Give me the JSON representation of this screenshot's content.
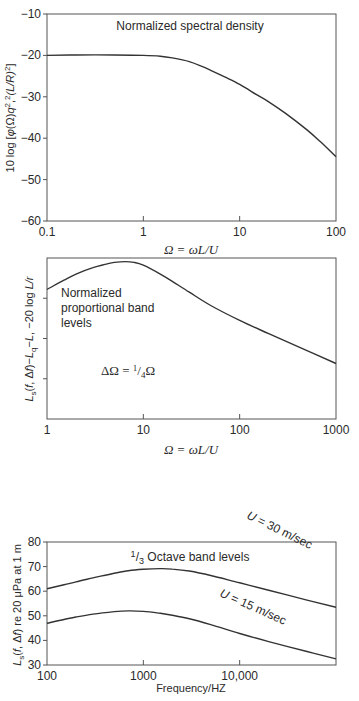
{
  "chart_data": [
    {
      "type": "line",
      "title": "Normalized spectral density",
      "xlabel": "Ω = ωL/U",
      "ylabel": "10 log [φ(Ω)q²,²(L/R)²]",
      "xscale": "log",
      "xlim": [
        0.1,
        100
      ],
      "ylim": [
        -60,
        -10
      ],
      "x_ticks": [
        "0.1",
        "1",
        "10",
        "100"
      ],
      "x_tick_values": [
        0.1,
        1,
        10,
        100
      ],
      "y_ticks": [
        "−10",
        "−20",
        "−30",
        "−40",
        "−50",
        "−60"
      ],
      "y_tick_values": [
        -10,
        -20,
        -30,
        -40,
        -50,
        -60
      ],
      "grid": false,
      "series": [
        {
          "name": "Normalized spectral density",
          "x": [
            0.1,
            0.2,
            0.5,
            1,
            1.5,
            2,
            3,
            4,
            5,
            7,
            10,
            15,
            20,
            30,
            50,
            70,
            100
          ],
          "y": [
            -20,
            -19.9,
            -19.9,
            -20,
            -20.2,
            -20.6,
            -21.5,
            -22.6,
            -23.6,
            -25.2,
            -27,
            -29.5,
            -31.2,
            -34,
            -38,
            -41,
            -44.5
          ]
        }
      ]
    },
    {
      "type": "line",
      "title": "Normalized proportional band levels",
      "annotation": "ΔΩ = ¼Ω",
      "xlabel": "Ω = ωL/U",
      "ylabel": "Ls(f, Δf)−Lq−L, −20 log L/r",
      "xscale": "log",
      "xlim": [
        1,
        1000
      ],
      "ylim": [
        0,
        4
      ],
      "y_units": "tick divisions (no labeled values)",
      "x_ticks": [
        "1",
        "10",
        "100",
        "1000"
      ],
      "x_tick_values": [
        1,
        10,
        100,
        1000
      ],
      "y_ticks": [],
      "y_tick_values": [
        1,
        2,
        3
      ],
      "grid": false,
      "series": [
        {
          "name": "Normalized proportional band levels",
          "x": [
            1,
            1.5,
            2,
            3,
            4,
            5,
            6.5,
            8,
            10,
            15,
            20,
            30,
            50,
            100,
            200,
            500,
            1000
          ],
          "y": [
            3.22,
            3.45,
            3.6,
            3.76,
            3.84,
            3.89,
            3.91,
            3.89,
            3.82,
            3.6,
            3.42,
            3.15,
            2.82,
            2.45,
            2.12,
            1.7,
            1.38
          ]
        }
      ]
    },
    {
      "type": "line",
      "title": "1/3 Octave band levels",
      "xlabel": "Frequency/HZ",
      "ylabel": "Ls(f, Δf) re 20 μPa at 1 m",
      "xscale": "log",
      "xlim": [
        100,
        100000
      ],
      "ylim": [
        30,
        80
      ],
      "x_ticks": [
        "100",
        "1000",
        "10,000"
      ],
      "x_tick_values": [
        100,
        1000,
        10000
      ],
      "y_ticks": [
        "80",
        "70",
        "60",
        "50",
        "40",
        "30"
      ],
      "y_tick_values": [
        80,
        70,
        60,
        50,
        40,
        30
      ],
      "grid": false,
      "series": [
        {
          "name": "U = 30 m/sec",
          "x": [
            100,
            150,
            200,
            300,
            500,
            700,
            1000,
            1500,
            2000,
            3000,
            5000,
            10000,
            20000,
            50000,
            100000
          ],
          "y": [
            61,
            62.6,
            63.8,
            65.4,
            67.3,
            68.3,
            68.9,
            69.2,
            69.0,
            68.2,
            66.4,
            63.4,
            60.4,
            56.4,
            53.5
          ]
        },
        {
          "name": "U = 15 m/sec",
          "x": [
            100,
            150,
            200,
            300,
            500,
            700,
            1000,
            1500,
            2000,
            3000,
            5000,
            10000,
            20000,
            50000,
            100000
          ],
          "y": [
            47,
            48.5,
            49.5,
            50.7,
            51.7,
            52,
            51.8,
            51,
            50.2,
            48.8,
            46.4,
            42.8,
            39.5,
            35.5,
            32.5
          ]
        }
      ],
      "annotations": [
        "U = 30 m/sec",
        "U = 15 m/sec"
      ]
    }
  ],
  "labels": {
    "c1_title": "Normalized spectral density",
    "c1_xlabel": "Ω = ωL/U",
    "c2_title_l1": "Normalized",
    "c2_title_l2": "proportional band",
    "c2_title_l3": "levels",
    "c2_annot": "ΔΩ = ¼Ω",
    "c2_xlabel": "Ω = ωL/U",
    "c3_title": "⅓ Octave band levels",
    "c3_xlabel": "Frequency/HZ",
    "c3_s1": "U = 30 m/sec",
    "c3_s2": "U = 15 m/sec"
  }
}
